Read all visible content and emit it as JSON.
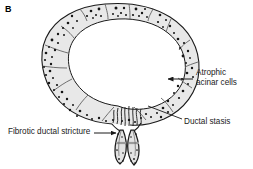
{
  "figure": {
    "panel_letter": "B",
    "background_color": "#ffffff",
    "ink_color": "#1a1a1a",
    "lobule_fill": "#e8e8e8",
    "duct_fill": "#e3e3e3",
    "stricture_band_color": "#9a9a9a"
  },
  "callouts": {
    "atrophic": "Atrophic\nacinar cells",
    "ductal_stasis": "Ductal stasis",
    "fibrotic": "Fibrotic ductal stricture"
  },
  "structures": {
    "acinar_ring_label": "acinar-lobule-ring",
    "lobule_count": 14,
    "duct_left_label": "left-dilated-duct",
    "duct_right_label": "right-dilated-duct",
    "secretion_squiggle_count": 8
  }
}
